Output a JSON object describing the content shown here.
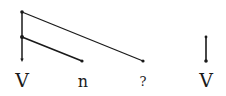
{
  "diagram": {
    "type": "dependency-tree",
    "stroke_color": "#1a1a1a",
    "nodes": [
      {
        "id": "w1",
        "label": "V",
        "x": 22
      },
      {
        "id": "w2",
        "label": "n",
        "x": 83
      },
      {
        "id": "w3",
        "label": "?",
        "x": 143
      },
      {
        "id": "w4",
        "label": "V",
        "x": 206
      }
    ],
    "edges": [
      {
        "from": "w1-top",
        "to": "w3",
        "desc": "long arc from top of V stem to ?"
      },
      {
        "from": "w1-mid",
        "to": "w2",
        "desc": "arc from middle of V stem to n"
      },
      {
        "from": "w1-top",
        "to": "w1",
        "desc": "vertical stem to V"
      },
      {
        "from": "w4-top",
        "to": "w4",
        "desc": "short vertical stem to V"
      }
    ]
  }
}
